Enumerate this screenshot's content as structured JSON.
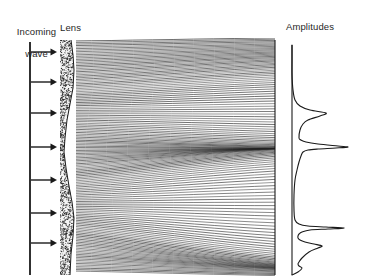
{
  "figure": {
    "title_labels": {
      "incoming_line1": "Incoming",
      "incoming_line2": "wave",
      "lens": "Lens",
      "amplitudes": "Amplitudes"
    },
    "colors": {
      "ink": "#1a1a1a",
      "ray": "#222222",
      "lens_fill": "#f4f4f4",
      "lens_stipple": "#2b2b2b",
      "background": "#ffffff"
    }
  },
  "chart_data": {
    "type": "line",
    "title": "Amplitudes",
    "xlabel": "",
    "ylabel": "",
    "grid": false,
    "legend": null,
    "axis": {
      "baseline_x": 292,
      "y_top": 45,
      "y_bottom": 275,
      "max_amplitude_px": 56
    },
    "x": [
      45,
      60,
      75,
      90,
      100,
      106,
      110,
      113,
      116,
      120,
      124,
      130,
      138,
      140,
      142,
      144,
      146,
      147,
      148,
      149,
      150,
      152,
      156,
      162,
      170,
      180,
      195,
      210,
      220,
      224,
      226,
      227,
      228,
      229,
      230,
      232,
      234,
      236,
      238,
      240,
      242,
      244,
      246,
      248,
      252,
      258,
      262,
      264,
      266,
      268,
      272,
      275
    ],
    "values": [
      0,
      0,
      0,
      1,
      3,
      8,
      18,
      34,
      28,
      16,
      11,
      8,
      7,
      9,
      14,
      26,
      46,
      56,
      44,
      26,
      16,
      11,
      9,
      7,
      5,
      3,
      2,
      2,
      3,
      7,
      16,
      34,
      52,
      36,
      18,
      10,
      7,
      6,
      6,
      8,
      13,
      22,
      30,
      26,
      17,
      10,
      7,
      6,
      7,
      10,
      6,
      0
    ],
    "peaks": [
      {
        "y_px": 113,
        "amplitude_px": 34,
        "label": "upper caustic peak"
      },
      {
        "y_px": 147,
        "amplitude_px": 56,
        "label": "central caustic peak"
      },
      {
        "y_px": 228,
        "amplitude_px": 52,
        "label": "lower caustic spike"
      },
      {
        "y_px": 246,
        "amplitude_px": 30,
        "label": "lower caustic lobe"
      }
    ]
  },
  "scene": {
    "incoming_wave": {
      "wavefront_x": 30,
      "wavefront_y_top": 42,
      "wavefront_y_bottom": 275,
      "arrow_count": 7,
      "arrow_ys": [
        52,
        82,
        113,
        147,
        180,
        213,
        243
      ],
      "arrow_x_start": 31,
      "arrow_x_end": 57
    },
    "lens": {
      "x_left": 60,
      "x_right": 76,
      "y_top": 40,
      "y_bottom": 275,
      "texture": "stipple",
      "profile_points": [
        [
          71,
          40
        ],
        [
          73,
          55
        ],
        [
          74,
          70
        ],
        [
          73,
          88
        ],
        [
          70,
          104
        ],
        [
          67,
          120
        ],
        [
          65,
          138
        ],
        [
          64,
          152
        ],
        [
          66,
          168
        ],
        [
          69,
          186
        ],
        [
          72,
          202
        ],
        [
          74,
          218
        ],
        [
          73,
          236
        ],
        [
          71,
          254
        ],
        [
          70,
          275
        ]
      ]
    },
    "ray_field": {
      "x_start": 76,
      "x_end": 275,
      "y_top": 40,
      "y_bottom": 272,
      "ray_count": 150,
      "caustics": [
        {
          "name": "upper-caustic",
          "y_left": 128,
          "y_right": 113
        },
        {
          "name": "central-caustic",
          "y_left": 150,
          "y_right": 147
        },
        {
          "name": "lower-caustic",
          "y_left": 232,
          "y_right": 228
        }
      ]
    },
    "screen": {
      "x": 275,
      "y_top": 40,
      "y_bottom": 275
    }
  }
}
